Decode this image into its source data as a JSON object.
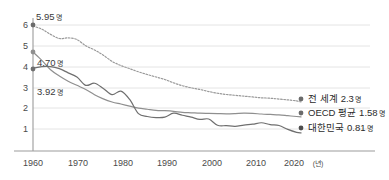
{
  "chart_data": {
    "type": "line",
    "title": "",
    "subtitle": "",
    "xlabel": "(년)",
    "ylabel": "",
    "xlim": [
      1960,
      2023
    ],
    "ylim": [
      0,
      6.3
    ],
    "grid": true,
    "legend_position": "right-inline",
    "x_ticks": [
      "1960",
      "1970",
      "1980",
      "1990",
      "2000",
      "2010",
      "2020"
    ],
    "x_tick_values": [
      1960,
      1970,
      1980,
      1990,
      2000,
      2010,
      2020
    ],
    "x_tick_suffix": "(년)",
    "y_ticks": [
      "1",
      "2",
      "3",
      "4",
      "5",
      "6"
    ],
    "y_tick_values": [
      1,
      2,
      3,
      4,
      5,
      6
    ],
    "unit": "명",
    "start_annotations": [
      {
        "label": "5.95",
        "unit": "명",
        "value": 5.95,
        "series": "전 세계"
      },
      {
        "label": "4.70",
        "unit": "명",
        "value": 4.7,
        "series": "OECD 평균"
      },
      {
        "label": "3.92",
        "unit": "명",
        "value": 3.92,
        "series": "대한민국"
      }
    ],
    "series": [
      {
        "name": "전 세계",
        "end_value": "2.3",
        "end_unit": "명",
        "style": "dotted",
        "color": "#9a9a9a",
        "x": [
          1960,
          1962,
          1964,
          1966,
          1968,
          1970,
          1972,
          1974,
          1976,
          1978,
          1980,
          1982,
          1984,
          1986,
          1988,
          1990,
          1992,
          1994,
          1996,
          1998,
          2000,
          2002,
          2004,
          2006,
          2008,
          2010,
          2012,
          2014,
          2016,
          2018,
          2020,
          2021
        ],
        "values": [
          5.95,
          5.8,
          5.55,
          5.35,
          5.38,
          5.3,
          5.0,
          4.8,
          4.55,
          4.25,
          4.05,
          3.9,
          3.75,
          3.62,
          3.5,
          3.38,
          3.22,
          3.08,
          2.98,
          2.9,
          2.8,
          2.72,
          2.66,
          2.62,
          2.58,
          2.54,
          2.5,
          2.48,
          2.44,
          2.4,
          2.35,
          2.3
        ]
      },
      {
        "name": "OECD 평균",
        "end_value": "1.58",
        "end_unit": "명",
        "style": "solid",
        "color": "#8f8f8f",
        "x": [
          1960,
          1962,
          1964,
          1966,
          1968,
          1970,
          1972,
          1974,
          1976,
          1978,
          1980,
          1982,
          1984,
          1986,
          1988,
          1990,
          1992,
          1994,
          1996,
          1998,
          2000,
          2002,
          2004,
          2006,
          2008,
          2010,
          2012,
          2014,
          2016,
          2018,
          2020,
          2021
        ],
        "values": [
          4.7,
          4.3,
          3.85,
          3.55,
          3.3,
          3.1,
          2.9,
          2.65,
          2.45,
          2.3,
          2.2,
          2.1,
          2.0,
          1.95,
          1.9,
          1.88,
          1.85,
          1.8,
          1.78,
          1.76,
          1.75,
          1.74,
          1.73,
          1.74,
          1.76,
          1.75,
          1.72,
          1.7,
          1.68,
          1.64,
          1.6,
          1.58
        ]
      },
      {
        "name": "대한민국",
        "end_value": "0.81",
        "end_unit": "명",
        "style": "solid",
        "color": "#6f6f6f",
        "x": [
          1960,
          1962,
          1964,
          1966,
          1968,
          1970,
          1972,
          1974,
          1976,
          1978,
          1980,
          1982,
          1984,
          1986,
          1988,
          1990,
          1992,
          1994,
          1996,
          1998,
          2000,
          2002,
          2004,
          2006,
          2008,
          2010,
          2012,
          2014,
          2016,
          2018,
          2020,
          2021
        ],
        "values": [
          3.92,
          4.0,
          4.0,
          3.9,
          3.7,
          3.5,
          3.1,
          3.2,
          2.95,
          2.65,
          2.82,
          2.42,
          1.74,
          1.6,
          1.55,
          1.57,
          1.76,
          1.66,
          1.57,
          1.46,
          1.48,
          1.18,
          1.16,
          1.13,
          1.19,
          1.23,
          1.3,
          1.21,
          1.17,
          0.98,
          0.84,
          0.81
        ]
      }
    ]
  },
  "axis": {
    "y_label_1": "1",
    "y_label_2": "2",
    "y_label_3": "3",
    "y_label_4": "4",
    "y_label_5": "5",
    "y_label_6": "6",
    "x_label_1960": "1960",
    "x_label_1970": "1970",
    "x_label_1980": "1980",
    "x_label_1990": "1990",
    "x_label_2000": "2000",
    "x_label_2010": "2010",
    "x_label_2020": "2020",
    "x_unit": "(년)"
  },
  "annotations": {
    "world_start": "5.95",
    "world_start_unit": "명",
    "oecd_start": "4.70",
    "oecd_start_unit": "명",
    "korea_start": "3.92",
    "korea_start_unit": "명"
  },
  "legend": {
    "world_name": "전 세계",
    "world_value": "2.3",
    "world_unit": "명",
    "oecd_name": "OECD 평균",
    "oecd_value": "1.58",
    "oecd_unit": "명",
    "korea_name": "대한민국",
    "korea_value": "0.81",
    "korea_unit": "명"
  },
  "colors": {
    "grid": "#e2e2e2",
    "axis": "#9b9b9b",
    "world": "#9a9a9a",
    "oecd": "#8f8f8f",
    "korea": "#6f6f6f",
    "text": "#3a3a3a",
    "background": "#ffffff"
  }
}
